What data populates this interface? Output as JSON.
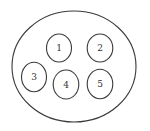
{
  "diagram": {
    "outer": {
      "cx": 74,
      "cy": 66.5,
      "rx": 62,
      "ry": 55.5
    },
    "nodes": [
      {
        "label": "1",
        "cx": 59,
        "cy": 48,
        "rx": 12.5,
        "ry": 14
      },
      {
        "label": "2",
        "cx": 100,
        "cy": 48,
        "rx": 12.8,
        "ry": 14
      },
      {
        "label": "3",
        "cx": 34,
        "cy": 77,
        "rx": 12.5,
        "ry": 14.8
      },
      {
        "label": "4",
        "cx": 66,
        "cy": 84.5,
        "rx": 12.8,
        "ry": 14.5
      },
      {
        "label": "5",
        "cx": 100,
        "cy": 84,
        "rx": 12.8,
        "ry": 14.8
      }
    ],
    "stroke_color": "#3a3a3a"
  }
}
